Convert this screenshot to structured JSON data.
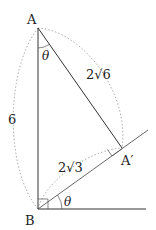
{
  "diagram": {
    "points": {
      "A": {
        "label": "A",
        "x": 38,
        "y": 28
      },
      "B": {
        "label": "B",
        "x": 38,
        "y": 209
      },
      "A_prime": {
        "label": "A′",
        "x": 122,
        "y": 148
      }
    },
    "angle_label": "θ",
    "side_labels": {
      "AB": "6",
      "AA_prime": "2√6",
      "BA_prime": "2√3"
    },
    "colors": {
      "line": "#333333",
      "arc": "#999999",
      "text": "#222222"
    }
  }
}
